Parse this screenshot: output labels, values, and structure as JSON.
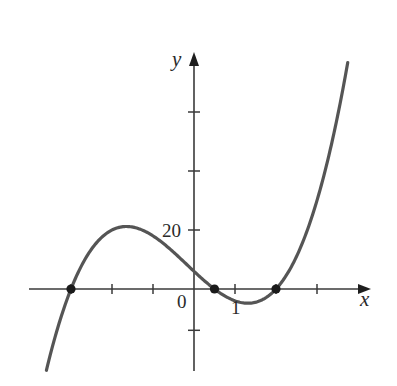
{
  "chart_data": {
    "type": "line",
    "title": "",
    "xlabel": "x",
    "ylabel": "y",
    "function": "y = (x + 3)(2x - 1)(x - 2)",
    "xlim": [
      -3.6,
      3.75
    ],
    "ylim": [
      -28,
      80
    ],
    "grid": false,
    "legend": null,
    "x_tick_values": [
      -3,
      -2,
      -1,
      1,
      2,
      3
    ],
    "x_tick_labels": [
      {
        "value": 0,
        "text": "0"
      },
      {
        "value": 1,
        "text": "1"
      }
    ],
    "y_tick_values": [
      20,
      40,
      60,
      -14
    ],
    "y_tick_labels": [
      {
        "value": 20,
        "text": "20"
      }
    ],
    "marked_points": [
      {
        "x": -3,
        "y": 0
      },
      {
        "x": 0.5,
        "y": 0
      },
      {
        "x": 2,
        "y": 0
      }
    ],
    "sample_points": [
      {
        "x": -3.56,
        "y": -25.3
      },
      {
        "x": -3.0,
        "y": 0
      },
      {
        "x": -2.5,
        "y": 16.5
      },
      {
        "x": -1.8,
        "y": 21.0
      },
      {
        "x": -1.0,
        "y": 18.0
      },
      {
        "x": 0,
        "y": 6
      },
      {
        "x": 0.5,
        "y": 0
      },
      {
        "x": 1.0,
        "y": -4
      },
      {
        "x": 1.3,
        "y": -4.8
      },
      {
        "x": 2.0,
        "y": 0
      },
      {
        "x": 3.0,
        "y": 30
      },
      {
        "x": 3.73,
        "y": 75.2
      }
    ],
    "colors": {
      "curve": "#555555",
      "axes": "#3a3a3a",
      "points": "#1a1a1a"
    }
  },
  "labels": {
    "x_axis": "x",
    "y_axis": "y",
    "origin": "0",
    "x_one": "1",
    "y_twenty": "20"
  }
}
